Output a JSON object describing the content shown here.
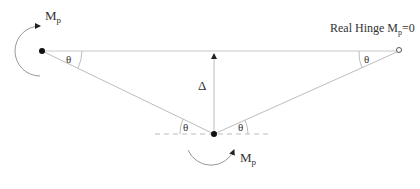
{
  "diagram": {
    "left_moment": {
      "label": "M",
      "sub": "p"
    },
    "bottom_moment": {
      "label": "M",
      "sub": "p"
    },
    "right_hinge_label": {
      "prefix": "Real Hinge M",
      "sub": "p",
      "suffix": "=0"
    },
    "deflection_label": "Δ",
    "angle_labels": [
      "θ",
      "θ",
      "θ",
      "θ"
    ],
    "colors": {
      "line": "#bdbdbd",
      "dot": "#111111",
      "text": "#333333"
    }
  }
}
